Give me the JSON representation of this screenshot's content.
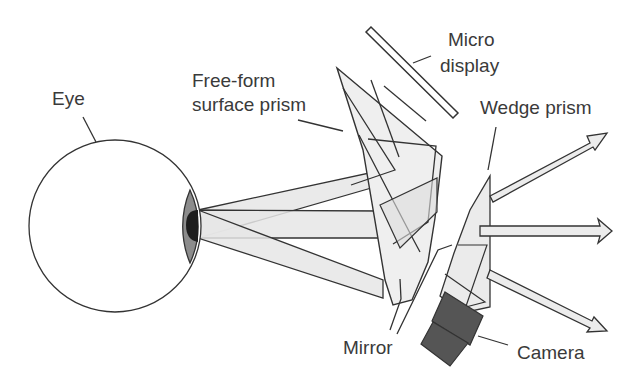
{
  "diagram": {
    "type": "optical-schematic",
    "labels": {
      "eye": "Eye",
      "freeform_line1": "Free-form",
      "freeform_line2": "surface prism",
      "micro_line1": "Micro",
      "micro_line2": "display",
      "wedge": "Wedge prism",
      "mirror": "Mirror",
      "camera": "Camera"
    },
    "colors": {
      "stroke": "#333333",
      "beam_fill": "#e4e4e4",
      "iris": "#8c8c8c",
      "pupil": "#1e1e1e",
      "camera": "#555555"
    }
  }
}
